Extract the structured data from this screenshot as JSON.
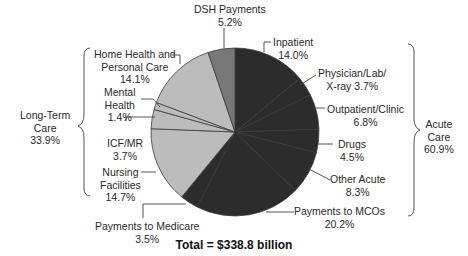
{
  "chart_data": {
    "type": "pie",
    "title": "",
    "footer": "Total = $338.8 billion",
    "total": 338.8,
    "unit": "billion USD",
    "slices": [
      {
        "label": "Inpatient",
        "value": 14.0,
        "group": "Acute Care",
        "color": "#2c2c2c"
      },
      {
        "label": "Physician/Lab/X-ray",
        "value": 3.7,
        "group": "Acute Care",
        "color": "#2c2c2c"
      },
      {
        "label": "Outpatient/Clinic",
        "value": 6.8,
        "group": "Acute Care",
        "color": "#2c2c2c"
      },
      {
        "label": "Drugs",
        "value": 4.5,
        "group": "Acute Care",
        "color": "#2c2c2c"
      },
      {
        "label": "Other Acute",
        "value": 8.3,
        "group": "Acute Care",
        "color": "#2c2c2c"
      },
      {
        "label": "Payments to MCOs",
        "value": 20.2,
        "group": "Acute Care",
        "color": "#2c2c2c"
      },
      {
        "label": "Payments to Medicare",
        "value": 3.5,
        "group": "Acute Care",
        "color": "#2c2c2c"
      },
      {
        "label": "Nursing Facilities",
        "value": 14.7,
        "group": "Long-Term Care",
        "color": "#bcbcbc"
      },
      {
        "label": "ICF/MR",
        "value": 3.7,
        "group": "Long-Term Care",
        "color": "#bcbcbc"
      },
      {
        "label": "Mental Health",
        "value": 1.4,
        "group": "Long-Term Care",
        "color": "#bcbcbc"
      },
      {
        "label": "Home Health and Personal Care",
        "value": 14.1,
        "group": "Long-Term Care",
        "color": "#bcbcbc"
      },
      {
        "label": "DSH Payments",
        "value": 5.2,
        "group": "DSH",
        "color": "#787878"
      }
    ],
    "groups": [
      {
        "label": "Acute Care",
        "value": 60.9
      },
      {
        "label": "Long-Term Care",
        "value": 33.9
      }
    ]
  },
  "labels": {
    "inpatient": [
      "Inpatient",
      "14.0%"
    ],
    "physician": [
      "Physician/Lab/",
      "X-ray 3.7%"
    ],
    "outpatient": [
      "Outpatient/Clinic",
      "6.8%"
    ],
    "drugs": [
      "Drugs",
      "4.5%"
    ],
    "other_acute": [
      "Other Acute",
      "8.3%"
    ],
    "mcos": [
      "Payments to MCOs",
      "20.2%"
    ],
    "medicare": [
      "Payments to Medicare",
      "3.5%"
    ],
    "nursing": [
      "Nursing",
      "Facilities",
      "14.7%"
    ],
    "icfmr": [
      "ICF/MR",
      "3.7%"
    ],
    "mental": [
      "Mental",
      "Health",
      "1.4%"
    ],
    "home_health": [
      "Home Health and",
      "Personal Care",
      "14.1%"
    ],
    "dsh": [
      "DSH Payments",
      "5.2%"
    ],
    "acute_group": [
      "Acute",
      "Care",
      "60.9%"
    ],
    "ltc_group": [
      "Long-Term",
      "Care",
      "33.9%"
    ]
  },
  "footer": "Total = $338.8 billion"
}
